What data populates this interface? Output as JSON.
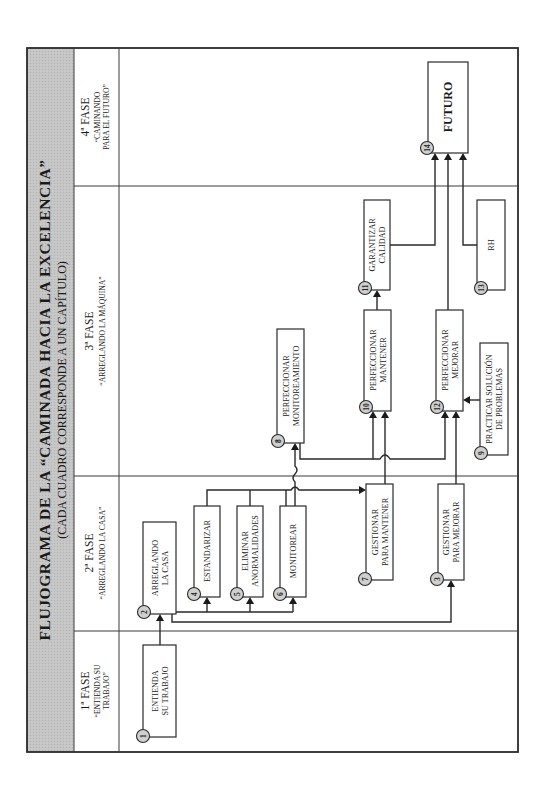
{
  "diagram": {
    "title": "FLUJOGRAMA DE LA “CAMINADA HACIA LA EXCELENCIA”",
    "subtitle": "(CADA CUADRO CORRESPONDE A UN CAPÍTULO)",
    "orientation": "rotated 90° counter-clockwise",
    "colors": {
      "header_band": "#c8c8c8",
      "lines": "#2a2a2a",
      "badge_fill": "#cfcfcf",
      "background": "#ffffff"
    },
    "phases": [
      {
        "id": "fase1",
        "label": "1ª FASE",
        "sub1": "“ENTIENDA SU",
        "sub2": "TRABAJO”"
      },
      {
        "id": "fase2",
        "label": "2ª FASE",
        "sub1": "“ARREGLANDO LA CASA”",
        "sub2": ""
      },
      {
        "id": "fase3",
        "label": "3ª FASE",
        "sub1": "“ARREGLANDO LA MÁQUINA”",
        "sub2": ""
      },
      {
        "id": "fase4",
        "label": "4ª FASE",
        "sub1": "“CAMINANDO",
        "sub2": "PARA EL FUTURO”"
      }
    ],
    "boxes": [
      {
        "num": "1",
        "line1": "ENTIENDA",
        "line2": "SU TRABAJO",
        "phase": "fase1"
      },
      {
        "num": "2",
        "line1": "ARREGLANDO",
        "line2": "LA CASA",
        "phase": "fase2"
      },
      {
        "num": "3",
        "line1": "GESTIONAR",
        "line2": "PARA MEJORAR",
        "phase": "fase2"
      },
      {
        "num": "4",
        "line1": "ESTANDARIZAR",
        "line2": "",
        "phase": "fase2"
      },
      {
        "num": "5",
        "line1": "ELIMINAR",
        "line2": "ANORMALIDADES",
        "phase": "fase2"
      },
      {
        "num": "6",
        "line1": "MONITOREAR",
        "line2": "",
        "phase": "fase2"
      },
      {
        "num": "7",
        "line1": "GESTIONAR",
        "line2": "PARA MANTENER",
        "phase": "fase2"
      },
      {
        "num": "8",
        "line1": "PERFECCIONAR",
        "line2": "MONITOREAMIENTO",
        "phase": "fase3"
      },
      {
        "num": "9",
        "line1": "PRACTICAR SOLUCIÓN",
        "line2": "DE PROBLEMAS",
        "phase": "fase3"
      },
      {
        "num": "10",
        "line1": "PERFECCIONAR",
        "line2": "MANTENER",
        "phase": "fase3"
      },
      {
        "num": "11",
        "line1": "GARANTIZAR",
        "line2": "CALIDAD",
        "phase": "fase3"
      },
      {
        "num": "12",
        "line1": "PERFECCIONAR",
        "line2": "MEJORAR",
        "phase": "fase3"
      },
      {
        "num": "13",
        "line1": "RH",
        "line2": "",
        "phase": "fase3"
      },
      {
        "num": "14",
        "line1": "FUTURO",
        "line2": "",
        "phase": "fase4"
      }
    ],
    "edges": [
      {
        "from": "1",
        "to": "2"
      },
      {
        "from": "2",
        "to": "4"
      },
      {
        "from": "2",
        "to": "5"
      },
      {
        "from": "2",
        "to": "6"
      },
      {
        "from": "2",
        "to": "3"
      },
      {
        "from": "4",
        "to": "7"
      },
      {
        "from": "5",
        "to": "7"
      },
      {
        "from": "6",
        "to": "7"
      },
      {
        "from": "6",
        "to": "8"
      },
      {
        "from": "7",
        "to": "10"
      },
      {
        "from": "8",
        "to": "10"
      },
      {
        "from": "8",
        "to": "12"
      },
      {
        "from": "3",
        "to": "12"
      },
      {
        "from": "9",
        "to": "12"
      },
      {
        "from": "10",
        "to": "11"
      },
      {
        "from": "11",
        "to": "14"
      },
      {
        "from": "12",
        "to": "14"
      },
      {
        "from": "13",
        "to": "14"
      }
    ]
  }
}
